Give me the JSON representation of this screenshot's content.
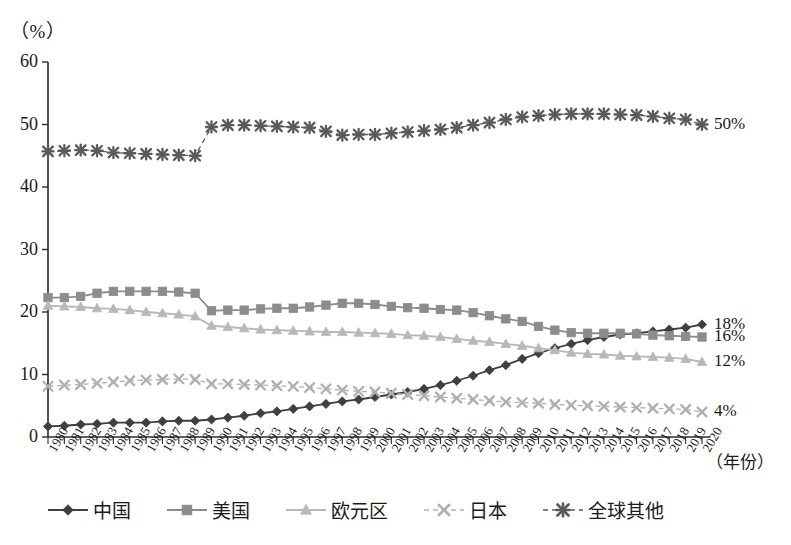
{
  "figure": {
    "unit_label": "（%）",
    "xaxis_title": "（年份）"
  },
  "legend": {
    "items": [
      {
        "label": "中国",
        "color": "#3f3f3f",
        "marker": "diamond",
        "dashed": false
      },
      {
        "label": "美国",
        "color": "#8c8c8c",
        "marker": "square",
        "dashed": false
      },
      {
        "label": "欧元区",
        "color": "#b8b8b8",
        "marker": "triangle",
        "dashed": false
      },
      {
        "label": "日本",
        "color": "#b0b0b0",
        "marker": "x",
        "dashed": true
      },
      {
        "label": "全球其他",
        "color": "#5a5a5a",
        "marker": "asterisk",
        "dashed": true
      }
    ]
  },
  "annotations": [
    {
      "text": "50%",
      "series": "全球其他",
      "value": 50
    },
    {
      "text": "18%",
      "series": "中国",
      "value": 18
    },
    {
      "text": "16%",
      "series": "美国",
      "value": 16
    },
    {
      "text": "12%",
      "series": "欧元区",
      "value": 12
    },
    {
      "text": "4%",
      "series": "日本",
      "value": 4
    }
  ],
  "chart_data": {
    "type": "line",
    "title": "",
    "xlabel": "（年份）",
    "ylabel": "（%）",
    "ylim": [
      0,
      60
    ],
    "yticks": [
      0,
      10,
      20,
      30,
      40,
      50,
      60
    ],
    "grid": false,
    "legend_position": "bottom",
    "x": [
      1980,
      1981,
      1982,
      1983,
      1984,
      1985,
      1986,
      1987,
      1988,
      1989,
      1990,
      1991,
      1992,
      1993,
      1994,
      1995,
      1996,
      1997,
      1998,
      1999,
      2000,
      2001,
      2002,
      2003,
      2004,
      2005,
      2006,
      2007,
      2008,
      2009,
      2010,
      2011,
      2012,
      2013,
      2014,
      2015,
      2016,
      2017,
      2018,
      2019,
      2020
    ],
    "categories": [
      "1980",
      "1981",
      "1982",
      "1983",
      "1984",
      "1985",
      "1986",
      "1987",
      "1988",
      "1989",
      "1990",
      "1991",
      "1992",
      "1993",
      "1994",
      "1995",
      "1996",
      "1997",
      "1998",
      "1999",
      "2000",
      "2001",
      "2002",
      "2003",
      "2004",
      "2005",
      "2006",
      "2007",
      "2008",
      "2009",
      "2010",
      "2011",
      "2012",
      "2013",
      "2014",
      "2015",
      "2016",
      "2017",
      "2018",
      "2019",
      "2020"
    ],
    "series": [
      {
        "name": "中国",
        "color": "#3f3f3f",
        "marker": "diamond",
        "dashed": false,
        "values": [
          1.7,
          1.8,
          2.0,
          2.1,
          2.3,
          2.3,
          2.3,
          2.5,
          2.6,
          2.6,
          2.8,
          3.1,
          3.4,
          3.8,
          4.1,
          4.5,
          4.9,
          5.3,
          5.7,
          6.0,
          6.4,
          6.8,
          7.2,
          7.7,
          8.3,
          9.0,
          9.8,
          10.7,
          11.5,
          12.5,
          13.4,
          14.2,
          14.9,
          15.5,
          16.0,
          16.4,
          16.6,
          16.9,
          17.2,
          17.5,
          18.0
        ]
      },
      {
        "name": "美国",
        "color": "#8c8c8c",
        "marker": "square",
        "dashed": false,
        "values": [
          22.3,
          22.3,
          22.5,
          23.0,
          23.3,
          23.3,
          23.3,
          23.3,
          23.2,
          23.0,
          20.2,
          20.3,
          20.3,
          20.5,
          20.6,
          20.6,
          20.8,
          21.1,
          21.4,
          21.4,
          21.2,
          20.9,
          20.7,
          20.6,
          20.4,
          20.3,
          19.9,
          19.4,
          18.9,
          18.5,
          17.7,
          17.1,
          16.7,
          16.6,
          16.6,
          16.6,
          16.5,
          16.3,
          16.2,
          16.1,
          16.0
        ]
      },
      {
        "name": "欧元区",
        "color": "#b8b8b8",
        "marker": "triangle",
        "dashed": false,
        "values": [
          21.0,
          20.9,
          20.8,
          20.6,
          20.5,
          20.3,
          20.0,
          19.8,
          19.6,
          19.3,
          17.8,
          17.6,
          17.4,
          17.2,
          17.1,
          17.0,
          16.9,
          16.8,
          16.8,
          16.7,
          16.6,
          16.5,
          16.3,
          16.2,
          16.0,
          15.7,
          15.4,
          15.2,
          14.9,
          14.6,
          14.2,
          13.9,
          13.5,
          13.3,
          13.2,
          13.0,
          12.9,
          12.8,
          12.7,
          12.5,
          12.0
        ]
      },
      {
        "name": "日本",
        "color": "#b0b0b0",
        "marker": "x",
        "dashed": true,
        "values": [
          8.1,
          8.3,
          8.4,
          8.6,
          8.8,
          9.0,
          9.1,
          9.2,
          9.3,
          9.2,
          8.5,
          8.5,
          8.4,
          8.3,
          8.2,
          8.1,
          7.9,
          7.7,
          7.5,
          7.3,
          7.2,
          7.0,
          6.8,
          6.6,
          6.4,
          6.2,
          6.0,
          5.8,
          5.6,
          5.5,
          5.4,
          5.2,
          5.1,
          5.0,
          4.9,
          4.8,
          4.7,
          4.6,
          4.5,
          4.4,
          4.0
        ]
      },
      {
        "name": "全球其他",
        "color": "#5a5a5a",
        "marker": "asterisk",
        "dashed": true,
        "values": [
          45.7,
          45.8,
          45.9,
          45.8,
          45.5,
          45.4,
          45.3,
          45.2,
          45.1,
          45.0,
          49.6,
          49.9,
          49.9,
          49.8,
          49.7,
          49.6,
          49.5,
          48.9,
          48.3,
          48.4,
          48.4,
          48.6,
          48.8,
          49.0,
          49.2,
          49.5,
          49.9,
          50.3,
          50.8,
          51.2,
          51.4,
          51.6,
          51.7,
          51.7,
          51.7,
          51.6,
          51.5,
          51.3,
          51.0,
          50.8,
          50.0
        ]
      }
    ]
  }
}
